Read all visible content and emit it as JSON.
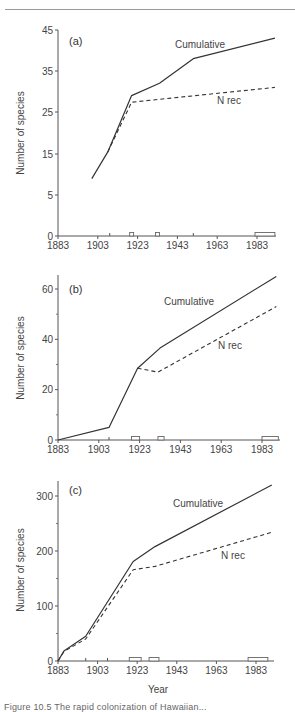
{
  "figure": {
    "caption": "Figure 10.5   The rapid colonization of Hawaiian..."
  },
  "chart_data": [
    {
      "type": "line",
      "panel": "(a)",
      "xlabel": "",
      "ylabel": "Number of species",
      "x_ticks": [
        1883,
        1903,
        1923,
        1943,
        1963,
        1983
      ],
      "y_ticks": [
        0,
        5,
        15,
        25,
        35,
        45
      ],
      "legend": [
        "Cumulative",
        "N rec"
      ],
      "series": [
        {
          "name": "Cumulative",
          "style": "solid",
          "x": [
            1900,
            1908,
            1920,
            1934,
            1951,
            1992
          ],
          "y": [
            9,
            15.5,
            29,
            32,
            38,
            43
          ]
        },
        {
          "name": "N rec",
          "style": "dashed",
          "x": [
            1908,
            1920,
            1992
          ],
          "y": [
            15.5,
            27.4,
            31
          ]
        }
      ],
      "axis_markers": [
        {
          "type": "tick",
          "year": 1909
        },
        {
          "type": "box",
          "from": 1919,
          "to": 1921
        },
        {
          "type": "box",
          "from": 1932,
          "to": 1934
        },
        {
          "type": "tick",
          "year": 1951
        },
        {
          "type": "box",
          "from": 1982,
          "to": 1992
        }
      ]
    },
    {
      "type": "line",
      "panel": "(b)",
      "xlabel": "",
      "ylabel": "Number of species",
      "x_ticks": [
        1883,
        1903,
        1923,
        1943,
        1963,
        1983
      ],
      "y_ticks": [
        0,
        20,
        40,
        60
      ],
      "y_minor_ticks": [
        10,
        30,
        50
      ],
      "legend": [
        "Cumulative",
        "N rec"
      ],
      "series": [
        {
          "name": "Cumulative",
          "style": "solid",
          "x": [
            1883,
            1908,
            1922,
            1933,
            1990
          ],
          "y": [
            0,
            5,
            28.5,
            36.5,
            65
          ]
        },
        {
          "name": "N rec",
          "style": "dashed",
          "x": [
            1922,
            1932,
            1990
          ],
          "y": [
            28.5,
            27,
            53
          ]
        }
      ],
      "axis_markers": [
        {
          "type": "tick",
          "year": 1908
        },
        {
          "type": "box",
          "from": 1919,
          "to": 1923
        },
        {
          "type": "box",
          "from": 1932,
          "to": 1935
        },
        {
          "type": "box",
          "from": 1983,
          "to": 1991
        }
      ]
    },
    {
      "type": "line",
      "panel": "(c)",
      "xlabel": "Year",
      "ylabel": "Number of species",
      "x_ticks": [
        1883,
        1903,
        1923,
        1943,
        1963,
        1983
      ],
      "y_ticks": [
        0,
        100,
        200,
        300
      ],
      "y_minor_ticks": [
        50,
        150,
        250
      ],
      "legend": [
        "Cumulative",
        "N rec"
      ],
      "series": [
        {
          "name": "Cumulative",
          "style": "solid",
          "x": [
            1883,
            1886,
            1897,
            1921,
            1932,
            1991
          ],
          "y": [
            0,
            18,
            45,
            181,
            208,
            320
          ]
        },
        {
          "name": "N rec",
          "style": "dashed",
          "x": [
            1883,
            1886,
            1897,
            1921,
            1932,
            1991
          ],
          "y": [
            0,
            17,
            40,
            166,
            172,
            234
          ]
        }
      ],
      "axis_markers": [
        {
          "type": "tick",
          "year": 1897
        },
        {
          "type": "tick",
          "year": 1908
        },
        {
          "type": "box",
          "from": 1919,
          "to": 1925
        },
        {
          "type": "box",
          "from": 1929,
          "to": 1934
        },
        {
          "type": "box",
          "from": 1979,
          "to": 1989
        }
      ]
    }
  ],
  "panels": [
    {
      "tag": "(a)",
      "cumulative_label": "Cumulative",
      "nrec_label": "N rec",
      "ylabel": "Number of species"
    },
    {
      "tag": "(b)",
      "cumulative_label": "Cumulative",
      "nrec_label": "N rec",
      "ylabel": "Number of species"
    },
    {
      "tag": "(c)",
      "cumulative_label": "Cumulative",
      "nrec_label": "N rec",
      "ylabel": "Number of species",
      "xlabel": "Year"
    }
  ]
}
